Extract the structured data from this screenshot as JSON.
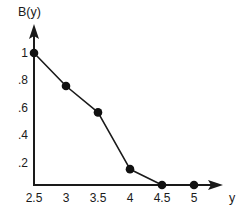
{
  "chart_data": {
    "type": "line",
    "title": "",
    "subtitle": "",
    "xlabel": "y",
    "ylabel": "B(y)",
    "x": [
      2.5,
      3,
      3.5,
      4,
      4.5,
      5
    ],
    "values": [
      1.0,
      0.75,
      0.55,
      0.12,
      0.0,
      0.0
    ],
    "series": [
      {
        "name": "B(y)",
        "values": [
          1.0,
          0.75,
          0.55,
          0.12,
          0.0,
          0.0
        ]
      }
    ],
    "xtick_labels": [
      "2.5",
      "3",
      "3.5",
      "4",
      "4.5",
      "5"
    ],
    "xtick_values": [
      2.5,
      3,
      3.5,
      4,
      4.5,
      5
    ],
    "ytick_labels": [
      "1",
      ".8",
      ".6",
      ".4",
      ".2"
    ],
    "ytick_values": [
      1.0,
      0.8,
      0.6,
      0.4,
      0.2
    ],
    "xlim": [
      2.5,
      5.35
    ],
    "ylim": [
      0,
      1.12
    ],
    "grid": false,
    "legend": "none",
    "markers": "filled-circle",
    "line_color": "#1a1a1a",
    "marker_color": "#111111",
    "axis_color": "#1a1a1a",
    "background_color": "#ffffff",
    "annotations": []
  },
  "axes": {
    "y_axis_name": "vertical-axis",
    "x_axis_name": "horizontal-axis",
    "y_arrow": "arrow-up",
    "x_arrow": "arrow-right"
  }
}
